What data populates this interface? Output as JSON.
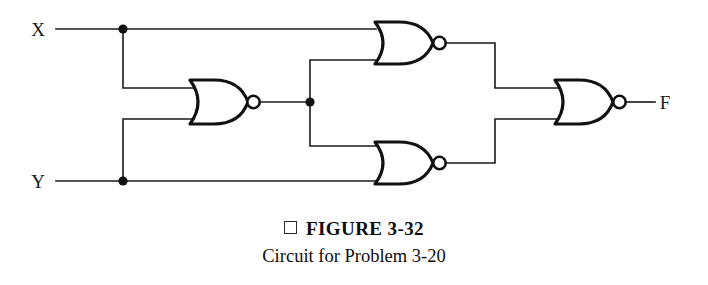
{
  "figure": {
    "bullet_icon": "square-bullet-icon",
    "label": "FIGURE 3-32",
    "description": "Circuit for Problem 3-20"
  },
  "circuit": {
    "type": "logic-gate-schematic",
    "inputs": [
      {
        "name": "X",
        "label": "X",
        "x": 38,
        "y": 29
      },
      {
        "name": "Y",
        "label": "Y",
        "x": 38,
        "y": 181
      }
    ],
    "outputs": [
      {
        "name": "F",
        "label": "F",
        "x": 665,
        "y": 102
      }
    ],
    "gates": [
      {
        "id": "nor1",
        "type": "NOR",
        "label": "nor-gate-1",
        "x": 190,
        "y": 102,
        "inputs": [
          "X",
          "Y"
        ],
        "output": "N1"
      },
      {
        "id": "nor2",
        "type": "NOR",
        "label": "nor-gate-2-top",
        "x": 375,
        "y": 43,
        "inputs": [
          "X",
          "N1"
        ],
        "output": "N2"
      },
      {
        "id": "nor3",
        "type": "NOR",
        "label": "nor-gate-3-bottom",
        "x": 375,
        "y": 163,
        "inputs": [
          "N1",
          "Y"
        ],
        "output": "N3"
      },
      {
        "id": "nor4",
        "type": "NOR",
        "label": "nor-gate-4-output",
        "x": 555,
        "y": 102,
        "inputs": [
          "N2",
          "N3"
        ],
        "output": "F"
      }
    ],
    "junctions": [
      {
        "name": "x-tap",
        "x": 123,
        "y": 29
      },
      {
        "name": "y-tap",
        "x": 123,
        "y": 181
      },
      {
        "name": "nor1-output-tap",
        "x": 310,
        "y": 102
      }
    ],
    "colors": {
      "wire": "#1a1a1a",
      "gate_outline": "#111111",
      "background": "#ffffff"
    }
  }
}
